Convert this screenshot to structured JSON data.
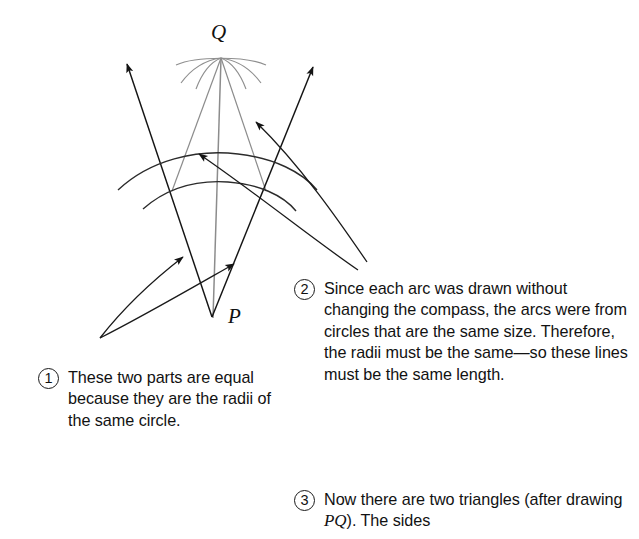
{
  "figure": {
    "type": "geometry-construction-diagram",
    "points": [
      {
        "name": "Q",
        "label": "Q",
        "x": 221,
        "y": 58
      },
      {
        "name": "P",
        "label": "P",
        "x": 212,
        "y": 317
      }
    ],
    "colors": {
      "background": "#ffffff",
      "ink": "#141414",
      "construction_line": "#8a8a8a",
      "arc": "#2b2b2b"
    }
  },
  "callouts": [
    {
      "number": "1",
      "text": "These two parts are equal because they are the radii of the same circle."
    },
    {
      "number": "2",
      "text": "Since each arc was drawn without changing the compass, the arcs were from circles that are the same size. Therefore, the radii must be the same—so these lines must be the same length."
    },
    {
      "number": "3",
      "text_before": "Now there are two triangles (after drawing ",
      "italic": "PQ",
      "text_after": "). The sides"
    }
  ]
}
